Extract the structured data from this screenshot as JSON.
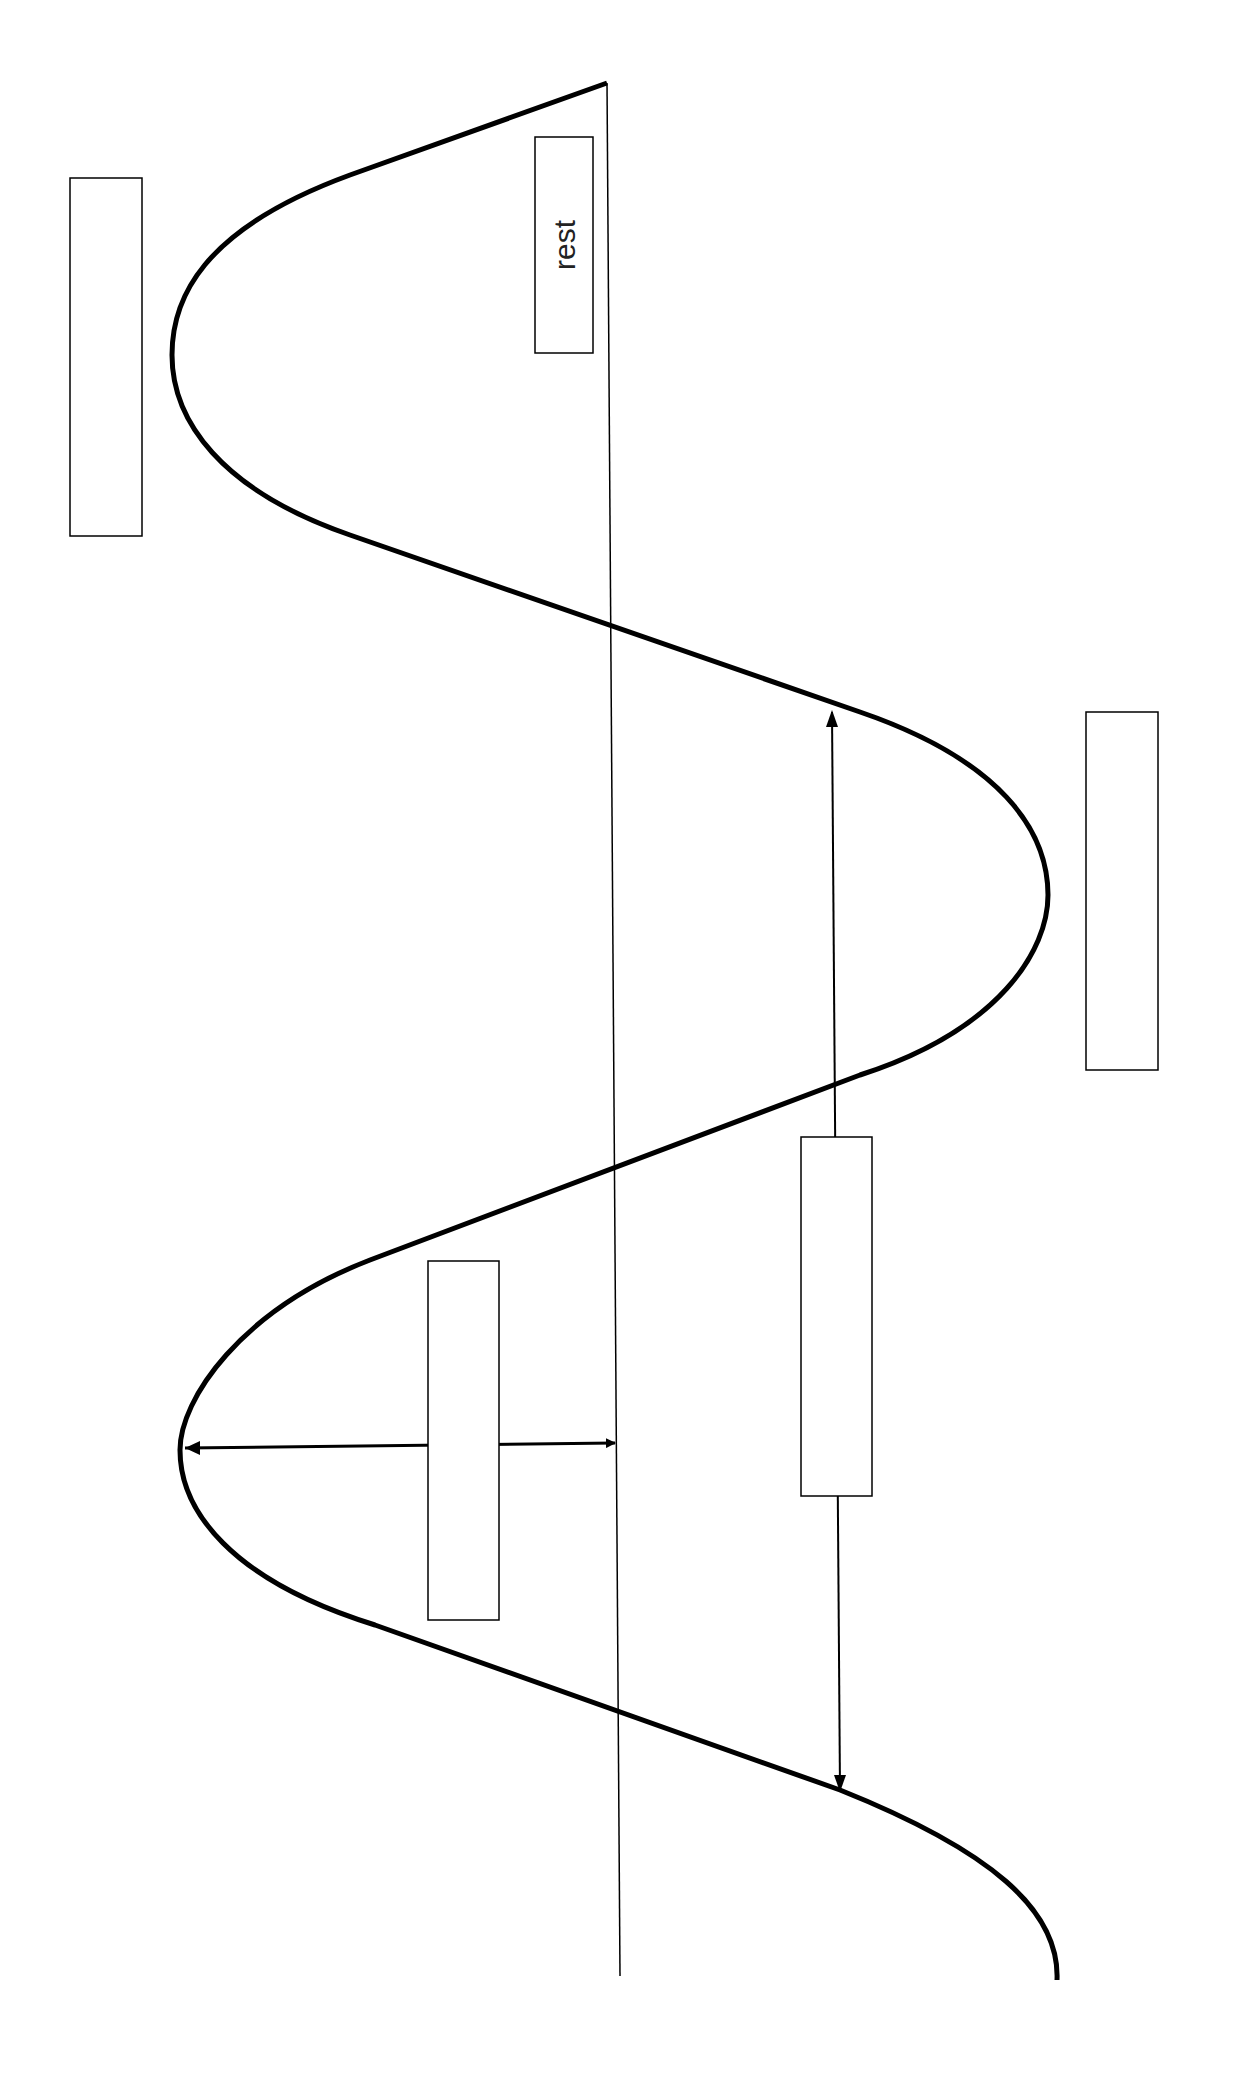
{
  "diagram": {
    "type": "transverse wave diagram (rotated)",
    "rest_label": "rest",
    "label_boxes": [
      {
        "id": "crest-top",
        "text": ""
      },
      {
        "id": "rest",
        "text": "rest"
      },
      {
        "id": "trough",
        "text": ""
      },
      {
        "id": "wavelength",
        "text": ""
      },
      {
        "id": "amplitude",
        "text": ""
      }
    ],
    "colors": {
      "line": "#000000",
      "background": "#ffffff"
    }
  }
}
